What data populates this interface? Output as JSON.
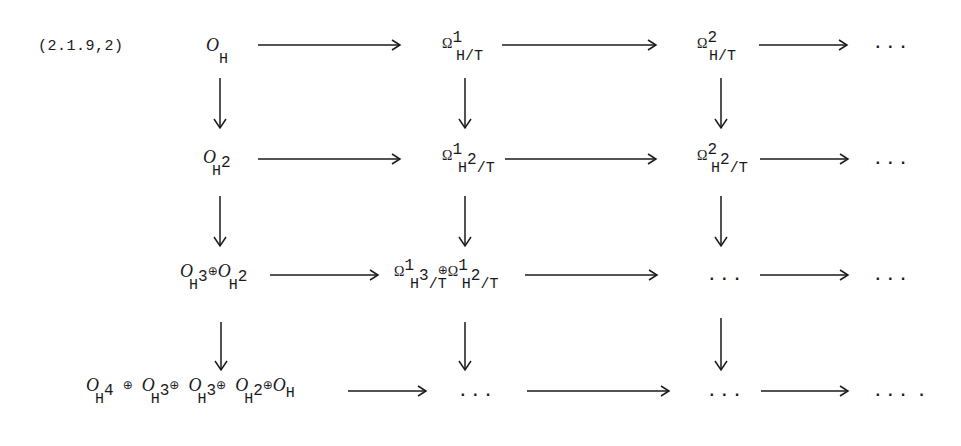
{
  "equation_label": "(2.1.9,2)",
  "symbols": {
    "sheaf": "O",
    "forms": "Ω",
    "direct_sum": "⊕",
    "ellipsis": "...",
    "final_period": "."
  },
  "rows": [
    {
      "nodes": [
        {
          "base": "O",
          "sub": "H",
          "sup": ""
        },
        {
          "base": "Ω",
          "sup": "1",
          "sub": "H/T"
        },
        {
          "base": "Ω",
          "sup": "2",
          "sub": "H/T"
        },
        {
          "text": "..."
        }
      ]
    },
    {
      "nodes": [
        {
          "base": "O",
          "sub": "H",
          "subsup": "2"
        },
        {
          "base": "Ω",
          "sup": "1",
          "sub": "H",
          "subsup": "2",
          "subtail": "/T"
        },
        {
          "base": "Ω",
          "sup": "2",
          "sub": "H",
          "subsup": "2",
          "subtail": "/T"
        },
        {
          "text": "..."
        }
      ]
    },
    {
      "nodes": [
        {
          "terms": [
            {
              "base": "O",
              "sub": "H",
              "subsup": "3"
            },
            {
              "base": "O",
              "sub": "H",
              "subsup": "2"
            }
          ]
        },
        {
          "terms": [
            {
              "base": "Ω",
              "sup": "1",
              "sub": "H",
              "subsup": "3",
              "subtail": "/T"
            },
            {
              "base": "Ω",
              "sup": "1",
              "sub": "H",
              "subsup": "2",
              "subtail": "/T"
            }
          ]
        },
        {
          "text": "..."
        },
        {
          "text": "..."
        }
      ]
    },
    {
      "nodes": [
        {
          "terms": [
            {
              "base": "O",
              "sub": "H",
              "subsup": "4"
            },
            {
              "base": "O",
              "sub": "H",
              "subsup": "3"
            },
            {
              "base": "O",
              "sub": "H",
              "subsup": "3"
            },
            {
              "base": "O",
              "sub": "H",
              "subsup": "2"
            },
            {
              "base": "O",
              "sub": "H"
            }
          ]
        },
        {
          "text": "..."
        },
        {
          "text": "..."
        },
        {
          "text": "...",
          "trailing": "."
        }
      ]
    }
  ],
  "arrows": {
    "horizontal_count": 12,
    "vertical_count": 9,
    "color": "#1a1a1a"
  }
}
